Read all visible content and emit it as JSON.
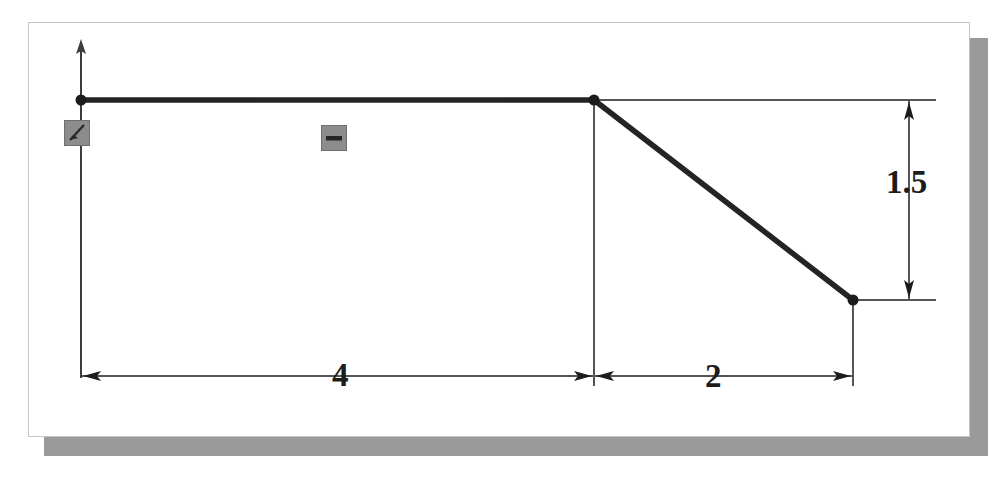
{
  "app": {
    "view_name": "sketch-canvas",
    "background_color": "#ffffff",
    "panel_border_color": "#c6c6c6",
    "shadow_color": "#9a9a9a"
  },
  "sketch": {
    "line_color": "#1c1c1c",
    "thin_line_color": "#555555",
    "geometry": {
      "origin_point": {
        "x": 0,
        "y": 0
      },
      "vertices": [
        {
          "name": "origin-vertex",
          "x": 0,
          "y": 0
        },
        {
          "name": "mid-vertex",
          "x": 4,
          "y": 0
        },
        {
          "name": "end-vertex",
          "x": 6,
          "y": -1.5
        }
      ],
      "segments": [
        {
          "name": "horizontal-segment",
          "from": "origin-vertex",
          "to": "mid-vertex"
        },
        {
          "name": "inclined-segment",
          "from": "mid-vertex",
          "to": "end-vertex"
        }
      ]
    },
    "axis": {
      "name": "vertical-axis",
      "label": ""
    },
    "constraints": [
      {
        "name": "fix-constraint",
        "icon": "anchor-fix-icon",
        "label": ""
      },
      {
        "name": "horizontal-constraint",
        "icon": "horizontal-bar-icon",
        "label": ""
      }
    ],
    "dimensions": [
      {
        "name": "dim-horizontal-4",
        "value": "4",
        "orientation": "horizontal"
      },
      {
        "name": "dim-horizontal-2",
        "value": "2",
        "orientation": "horizontal"
      },
      {
        "name": "dim-vertical-1-5",
        "value": "1.5",
        "orientation": "vertical"
      }
    ]
  }
}
